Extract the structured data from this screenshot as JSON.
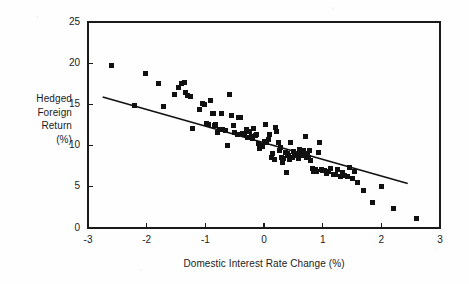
{
  "chart_data": {
    "type": "scatter",
    "title": "",
    "xlabel": "Domestic Interest Rate Change (%)",
    "ylabel_lines": [
      "Hedged",
      "Foreign",
      "Return",
      "(%)"
    ],
    "ylabel": "Hedged Foreign Return (%)",
    "xlim": [
      -3,
      3
    ],
    "ylim": [
      0,
      25
    ],
    "xticks": [
      -3,
      -2,
      -1,
      0,
      1,
      2,
      3
    ],
    "xtick_labels": [
      "-3",
      "-2",
      "-1",
      "0",
      "1",
      "2",
      "3"
    ],
    "yticks": [
      0,
      5,
      10,
      15,
      20,
      25
    ],
    "ytick_labels": [
      "0",
      "5",
      "10",
      "15",
      "20",
      "25"
    ],
    "grid": false,
    "legend": false,
    "marker": "filled-square",
    "marker_color": "#111111",
    "marker_size_px": 5,
    "frame_color": "#1a1a1a",
    "background_color": "#fefefe",
    "trendline": {
      "visible": true,
      "color": "#111111",
      "x_start": -2.75,
      "y_start": 15.9,
      "x_end": 2.45,
      "y_end": 5.4,
      "slope": -2.02,
      "intercept": 10.35
    },
    "points": [
      [
        -2.6,
        19.7
      ],
      [
        -2.2,
        14.85
      ],
      [
        -2.02,
        18.8
      ],
      [
        -1.8,
        17.55
      ],
      [
        -1.72,
        14.8
      ],
      [
        -1.52,
        16.25
      ],
      [
        -1.45,
        17.05
      ],
      [
        -1.4,
        17.55
      ],
      [
        -1.36,
        17.6
      ],
      [
        -1.34,
        16.45
      ],
      [
        -1.3,
        16.1
      ],
      [
        -1.25,
        15.95
      ],
      [
        -1.22,
        12.1
      ],
      [
        -1.1,
        14.35
      ],
      [
        -1.05,
        15.05
      ],
      [
        -1.02,
        14.95
      ],
      [
        -0.98,
        12.7
      ],
      [
        -0.95,
        12.55
      ],
      [
        -0.92,
        15.5
      ],
      [
        -0.88,
        13.95
      ],
      [
        -0.86,
        13.85
      ],
      [
        -0.84,
        12.4
      ],
      [
        -0.82,
        12.6
      ],
      [
        -0.8,
        11.55
      ],
      [
        -0.76,
        12.0
      ],
      [
        -0.72,
        13.95
      ],
      [
        -0.7,
        11.9
      ],
      [
        -0.66,
        11.8
      ],
      [
        -0.62,
        10.0
      ],
      [
        -0.58,
        16.25
      ],
      [
        -0.55,
        13.6
      ],
      [
        -0.52,
        12.5
      ],
      [
        -0.5,
        11.55
      ],
      [
        -0.46,
        11.3
      ],
      [
        -0.44,
        13.45
      ],
      [
        -0.4,
        13.4
      ],
      [
        -0.36,
        11.45
      ],
      [
        -0.33,
        11.35
      ],
      [
        -0.3,
        12.0
      ],
      [
        -0.28,
        11.0
      ],
      [
        -0.25,
        11.75
      ],
      [
        -0.22,
        11.1
      ],
      [
        -0.2,
        10.9
      ],
      [
        -0.18,
        12.05
      ],
      [
        -0.15,
        11.2
      ],
      [
        -0.12,
        11.3
      ],
      [
        -0.1,
        10.2
      ],
      [
        -0.08,
        9.6
      ],
      [
        -0.05,
        10.0
      ],
      [
        -0.02,
        9.95
      ],
      [
        0.0,
        10.45
      ],
      [
        0.03,
        12.6
      ],
      [
        0.05,
        10.35
      ],
      [
        0.08,
        10.8
      ],
      [
        0.1,
        11.3
      ],
      [
        0.12,
        8.55
      ],
      [
        0.15,
        9.0
      ],
      [
        0.18,
        8.3
      ],
      [
        0.2,
        12.25
      ],
      [
        0.22,
        11.7
      ],
      [
        0.24,
        10.4
      ],
      [
        0.26,
        9.4
      ],
      [
        0.28,
        9.8
      ],
      [
        0.3,
        8.55
      ],
      [
        0.32,
        7.95
      ],
      [
        0.34,
        8.4
      ],
      [
        0.36,
        9.2
      ],
      [
        0.38,
        6.75
      ],
      [
        0.4,
        9.1
      ],
      [
        0.42,
        8.85
      ],
      [
        0.44,
        8.3
      ],
      [
        0.46,
        10.35
      ],
      [
        0.48,
        8.6
      ],
      [
        0.5,
        9.3
      ],
      [
        0.52,
        8.75
      ],
      [
        0.55,
        9.0
      ],
      [
        0.58,
        8.4
      ],
      [
        0.6,
        9.55
      ],
      [
        0.62,
        8.95
      ],
      [
        0.65,
        8.75
      ],
      [
        0.68,
        9.4
      ],
      [
        0.7,
        11.15
      ],
      [
        0.72,
        8.6
      ],
      [
        0.74,
        9.1
      ],
      [
        0.76,
        8.5
      ],
      [
        0.78,
        9.35
      ],
      [
        0.8,
        8.2
      ],
      [
        0.82,
        7.2
      ],
      [
        0.85,
        6.9
      ],
      [
        0.88,
        7.05
      ],
      [
        0.9,
        6.85
      ],
      [
        0.93,
        9.2
      ],
      [
        0.95,
        10.35
      ],
      [
        0.98,
        7.15
      ],
      [
        1.0,
        6.95
      ],
      [
        1.03,
        7.0
      ],
      [
        1.06,
        6.6
      ],
      [
        1.1,
        6.9
      ],
      [
        1.14,
        7.25
      ],
      [
        1.18,
        6.55
      ],
      [
        1.22,
        6.45
      ],
      [
        1.26,
        7.05
      ],
      [
        1.3,
        6.2
      ],
      [
        1.34,
        6.7
      ],
      [
        1.38,
        6.4
      ],
      [
        1.42,
        6.25
      ],
      [
        1.46,
        7.4
      ],
      [
        1.5,
        6.0
      ],
      [
        1.55,
        6.85
      ],
      [
        1.6,
        5.55
      ],
      [
        1.7,
        4.5
      ],
      [
        1.85,
        3.05
      ],
      [
        2.0,
        5.05
      ],
      [
        2.2,
        2.35
      ],
      [
        2.6,
        1.2
      ]
    ]
  },
  "geometry": {
    "plot_left": 88,
    "plot_right": 440,
    "plot_top": 22,
    "plot_bottom": 228
  }
}
